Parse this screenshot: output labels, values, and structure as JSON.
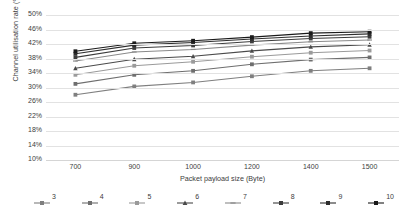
{
  "chart_data": {
    "type": "line",
    "title": "",
    "xlabel": "Packet payload size (Byte)",
    "ylabel": "Channel utilisation rate (%)",
    "x": [
      700,
      900,
      1000,
      1200,
      1400,
      1500
    ],
    "categories": [
      "700",
      "900",
      "1000",
      "1200",
      "1400",
      "1500"
    ],
    "xtick_labels": [
      "700",
      "900",
      "1000",
      "1200",
      "1400",
      "1500"
    ],
    "ytick_labels": [
      "50%",
      "46%",
      "42%",
      "38%",
      "34%",
      "30%",
      "26%",
      "22%",
      "18%",
      "14%",
      "10%"
    ],
    "ytick_values": [
      50,
      46,
      42,
      38,
      34,
      30,
      26,
      22,
      18,
      14,
      10
    ],
    "ylim": [
      10,
      50
    ],
    "yunit": "%",
    "grid": true,
    "legend_position": "bottom",
    "series": [
      {
        "name": "3",
        "marker": "square",
        "color": "#7f7f7f",
        "values": [
          28.0,
          30.3,
          31.4,
          33.1,
          34.6,
          35.3
        ]
      },
      {
        "name": "4",
        "marker": "square",
        "color": "#6e6e6e",
        "values": [
          31.0,
          33.5,
          34.6,
          36.4,
          37.7,
          38.3
        ]
      },
      {
        "name": "5",
        "marker": "square",
        "color": "#9a9a9a",
        "values": [
          33.5,
          36.0,
          37.1,
          38.5,
          39.6,
          40.2
        ]
      },
      {
        "name": "6",
        "marker": "triangle",
        "color": "#4a4a4a",
        "values": [
          35.3,
          37.8,
          38.6,
          40.1,
          41.2,
          41.8
        ]
      },
      {
        "name": "7",
        "marker": "line",
        "color": "#8a8a8a",
        "values": [
          37.3,
          39.8,
          40.5,
          41.7,
          42.6,
          43.1
        ]
      },
      {
        "name": "8",
        "marker": "square",
        "color": "#3c3c3c",
        "values": [
          38.3,
          40.9,
          41.6,
          42.7,
          43.5,
          44.0
        ]
      },
      {
        "name": "9",
        "marker": "square",
        "color": "#2e2e2e",
        "values": [
          39.3,
          41.7,
          42.4,
          43.4,
          44.2,
          44.8
        ]
      },
      {
        "name": "10",
        "marker": "square",
        "color": "#1a1a1a",
        "values": [
          40.0,
          42.2,
          42.9,
          43.9,
          45.0,
          45.4
        ]
      }
    ]
  }
}
